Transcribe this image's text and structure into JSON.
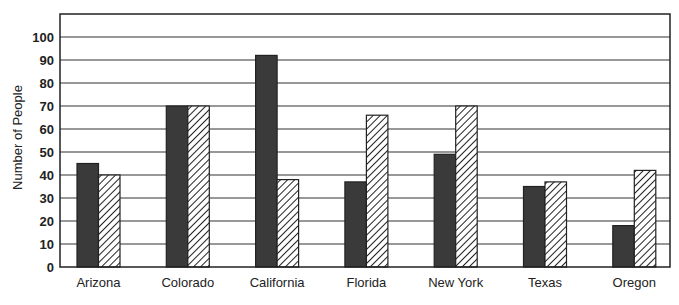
{
  "chart_data": {
    "type": "bar",
    "title": "",
    "xlabel": "",
    "ylabel": "Number of People",
    "ylim": [
      0,
      100
    ],
    "yticks": [
      0,
      10,
      20,
      30,
      40,
      50,
      60,
      70,
      80,
      90,
      100
    ],
    "grid": true,
    "legend": null,
    "categories": [
      "Arizona",
      "Colorado",
      "California",
      "Florida",
      "New York",
      "Texas",
      "Oregon"
    ],
    "series": [
      {
        "name": "Series 1 (solid dark)",
        "pattern": "solid",
        "color": "#3a3a3a",
        "values": [
          45,
          70,
          92,
          37,
          49,
          35,
          18
        ]
      },
      {
        "name": "Series 2 (hatched)",
        "pattern": "diagonal-hatch",
        "color": "#ffffff",
        "values": [
          40,
          70,
          38,
          66,
          70,
          37,
          42
        ]
      }
    ]
  },
  "colors": {
    "axis": "#222222",
    "grid": "#333333",
    "solid_bar": "#3a3a3a",
    "hatch_line": "#222222"
  }
}
